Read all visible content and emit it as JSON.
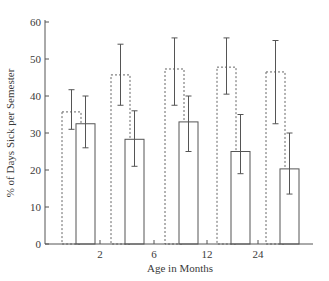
{
  "chart_data": {
    "type": "bar",
    "title": "",
    "xlabel": "Age in Months",
    "ylabel": "% of Days Sick per Semester",
    "ylim": [
      0,
      60
    ],
    "yticks": [
      0,
      10,
      20,
      30,
      40,
      50,
      60
    ],
    "xtick_labels": [
      "2",
      "6",
      "12",
      "24"
    ],
    "grid": false,
    "legend": null,
    "categories": [
      "Group 1",
      "Group 2",
      "Group 3",
      "Group 4",
      "Group 5"
    ],
    "series": [
      {
        "name": "dashed bars",
        "style": "dashed",
        "values": [
          35.7,
          45.7,
          47.3,
          47.8,
          46.5
        ],
        "error_low": [
          31,
          37.5,
          37.5,
          40.5,
          32.5
        ],
        "error_high": [
          41.7,
          54,
          55.7,
          55.7,
          55
        ]
      },
      {
        "name": "solid bars",
        "style": "solid",
        "values": [
          32.5,
          28.3,
          33,
          25,
          20.3
        ],
        "error_low": [
          26,
          21,
          25,
          19,
          13.5
        ],
        "error_high": [
          40,
          36,
          40,
          35,
          30
        ]
      }
    ]
  },
  "axes": {
    "y_label": "% of Days Sick per Semester",
    "x_label": "Age in Months",
    "y_tick_labels": [
      "0",
      "10",
      "20",
      "30",
      "40",
      "50",
      "60"
    ],
    "x_tick_labels": [
      "2",
      "6",
      "12",
      "24"
    ]
  }
}
